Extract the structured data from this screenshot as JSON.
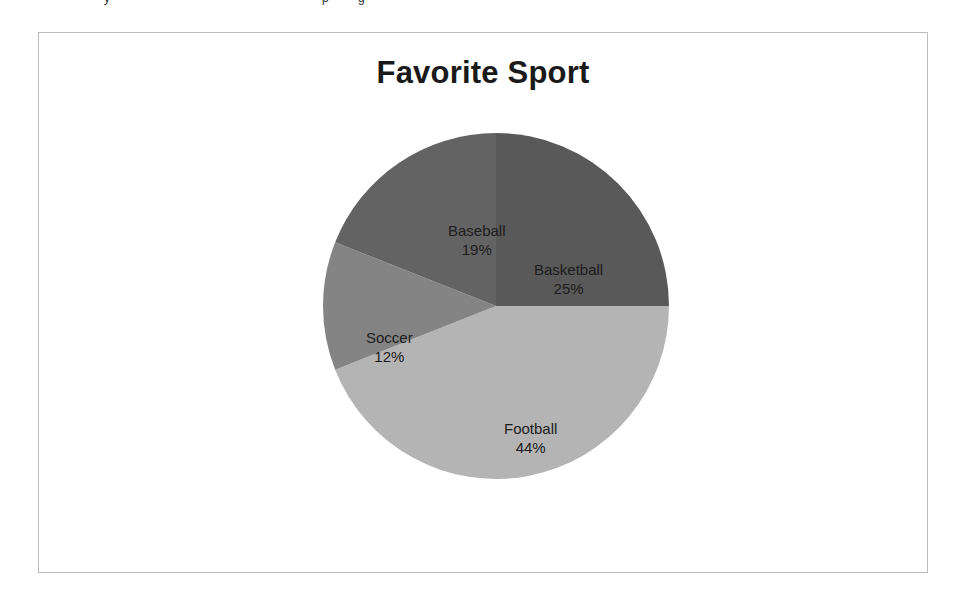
{
  "figure": {
    "clipped_fragments": [
      {
        "text": "y",
        "left": 104
      },
      {
        "text": "p",
        "left": 322
      },
      {
        "text": "g",
        "left": 358
      }
    ]
  },
  "chart_data": {
    "type": "pie",
    "title": "Favorite Sport",
    "xlabel": "",
    "ylabel": "",
    "units": "percent",
    "total": 100,
    "legend": "none",
    "grid": false,
    "start_angle_deg": 0,
    "direction": "clockwise",
    "categories": [
      "Basketball",
      "Football",
      "Soccer",
      "Baseball"
    ],
    "values": [
      25,
      44,
      12,
      19
    ],
    "slices": [
      {
        "label": "Basketball",
        "value": 25,
        "value_label": "25%",
        "color": "#595959",
        "start_deg": 0,
        "end_deg": 90,
        "label_x": 213,
        "label_y": 129
      },
      {
        "label": "Football",
        "value": 44,
        "value_label": "44%",
        "color": "#b4b4b4",
        "start_deg": 90,
        "end_deg": 248.4,
        "label_x": 183,
        "label_y": 288
      },
      {
        "label": "Soccer",
        "value": 12,
        "value_label": "12%",
        "color": "#848484",
        "start_deg": 248.4,
        "end_deg": 291.6,
        "label_x": 45,
        "label_y": 197
      },
      {
        "label": "Baseball",
        "value": 19,
        "value_label": "19%",
        "color": "#636363",
        "start_deg": 291.6,
        "end_deg": 360,
        "label_x": 127,
        "label_y": 90
      }
    ]
  }
}
